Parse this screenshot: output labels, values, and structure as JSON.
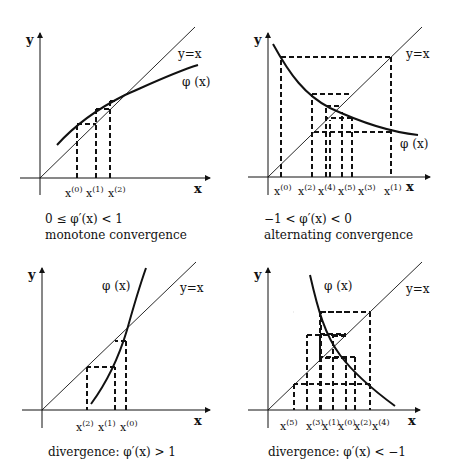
{
  "panels": [
    {
      "id": "monotone",
      "axis_x": "x",
      "axis_y": "y",
      "identity_label": "y=x",
      "curve_label": "φ (x)",
      "ticks": [
        "x",
        "x",
        "x"
      ],
      "tick_sups": [
        "(0)",
        "(1)",
        "(2)"
      ],
      "caption_math": "0 ≤ φ′(x) < 1",
      "caption_text": "monotone convergence"
    },
    {
      "id": "alternating",
      "axis_x": "x",
      "axis_y": "y",
      "identity_label": "y=x",
      "curve_label": "φ (x)",
      "ticks": [
        "x",
        "x",
        "x",
        "x",
        "x",
        "x"
      ],
      "tick_sups": [
        "(0)",
        "(2)",
        "(4)",
        "(5)",
        "(3)",
        "(1)"
      ],
      "caption_math": "−1 < φ′(x) < 0",
      "caption_text": "alternating convergence"
    },
    {
      "id": "divergence-positive",
      "axis_x": "x",
      "axis_y": "y",
      "identity_label": "y=x",
      "curve_label": "φ (x)",
      "ticks": [
        "x",
        "x",
        "x"
      ],
      "tick_sups": [
        "(2)",
        "(1)",
        "(0)"
      ],
      "caption_math": "divergence: φ′(x) > 1",
      "caption_text": ""
    },
    {
      "id": "divergence-negative",
      "axis_x": "x",
      "axis_y": "y",
      "identity_label": "y=x",
      "curve_label": "φ (x)",
      "ticks": [
        "x",
        "x",
        "x",
        "x",
        "x",
        "x"
      ],
      "tick_sups": [
        "(5)",
        "(3)",
        "(1)",
        "(0)",
        "(2)",
        "(4)"
      ],
      "caption_math": "divergence: φ′(x) < −1",
      "caption_text": ""
    }
  ]
}
